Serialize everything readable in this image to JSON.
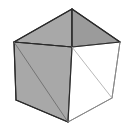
{
  "figure": {
    "canvas": {
      "width": 135,
      "height": 135,
      "background": "#ffffff"
    },
    "palette": {
      "stroke_dark": "#2b2b2b",
      "stroke_light": "#8a8a8a",
      "face_gray": "#a8a8a8",
      "face_gray_dark": "#9b9b9b",
      "face_gray_light": "#b4b4b4",
      "face_white": "#ffffff",
      "background": "#ffffff"
    },
    "vertices": {
      "apex_top": [
        72,
        9
      ],
      "corner_left": [
        14,
        42
      ],
      "corner_right": [
        120,
        42
      ],
      "center_front": [
        72,
        47
      ],
      "base_left": [
        16,
        100
      ],
      "base_front": [
        68,
        122
      ],
      "base_right": [
        112,
        98
      ]
    },
    "faces": [
      {
        "name": "top-left-back-triangle",
        "points": "72,9 14,42 72,47",
        "fill": "#a8a8a8",
        "stroke": "#2b2b2b",
        "stroke_width": 1.1
      },
      {
        "name": "top-right-back-triangle",
        "points": "72,9 120,42 72,47",
        "fill": "#9b9b9b",
        "stroke": "#2b2b2b",
        "stroke_width": 1.1
      },
      {
        "name": "left-side-face",
        "points": "14,42 72,47 68,122 16,100",
        "fill": "#a8a8a8",
        "stroke": "#2b2b2b",
        "stroke_width": 1.1
      },
      {
        "name": "right-side-face",
        "points": "72,47 120,42 112,98 68,122",
        "fill": "#ffffff",
        "stroke": "#8a8a8a",
        "stroke_width": 1.0
      }
    ],
    "edges": [
      {
        "name": "edge-apex-to-left",
        "from": [
          72,
          9
        ],
        "to": [
          14,
          42
        ],
        "stroke": "#2b2b2b",
        "stroke_width": 1.2
      },
      {
        "name": "edge-apex-to-right",
        "from": [
          72,
          9
        ],
        "to": [
          120,
          42
        ],
        "stroke": "#2b2b2b",
        "stroke_width": 1.2
      },
      {
        "name": "edge-apex-to-center",
        "from": [
          72,
          9
        ],
        "to": [
          72,
          47
        ],
        "stroke": "#2b2b2b",
        "stroke_width": 1.2
      },
      {
        "name": "edge-left-to-center",
        "from": [
          14,
          42
        ],
        "to": [
          72,
          47
        ],
        "stroke": "#2b2b2b",
        "stroke_width": 1.2
      },
      {
        "name": "edge-right-to-center",
        "from": [
          120,
          42
        ],
        "to": [
          72,
          47
        ],
        "stroke": "#2b2b2b",
        "stroke_width": 1.2
      },
      {
        "name": "edge-left-vertical",
        "from": [
          14,
          42
        ],
        "to": [
          16,
          100
        ],
        "stroke": "#2b2b2b",
        "stroke_width": 1.2
      },
      {
        "name": "edge-center-vertical",
        "from": [
          72,
          47
        ],
        "to": [
          68,
          122
        ],
        "stroke": "#2b2b2b",
        "stroke_width": 1.2
      },
      {
        "name": "edge-right-vertical",
        "from": [
          120,
          42
        ],
        "to": [
          112,
          98
        ],
        "stroke": "#8a8a8a",
        "stroke_width": 1.0
      },
      {
        "name": "edge-base-left-to-front",
        "from": [
          16,
          100
        ],
        "to": [
          68,
          122
        ],
        "stroke": "#2b2b2b",
        "stroke_width": 1.2
      },
      {
        "name": "edge-base-front-to-right",
        "from": [
          68,
          122
        ],
        "to": [
          112,
          98
        ],
        "stroke": "#8a8a8a",
        "stroke_width": 1.0
      },
      {
        "name": "edge-diagonal-left-face",
        "from": [
          14,
          42
        ],
        "to": [
          68,
          122
        ],
        "stroke": "#6e6e6e",
        "stroke_width": 0.9
      },
      {
        "name": "edge-diagonal-right-face",
        "from": [
          72,
          47
        ],
        "to": [
          112,
          98
        ],
        "stroke": "#b0b0b0",
        "stroke_width": 0.9
      }
    ]
  }
}
